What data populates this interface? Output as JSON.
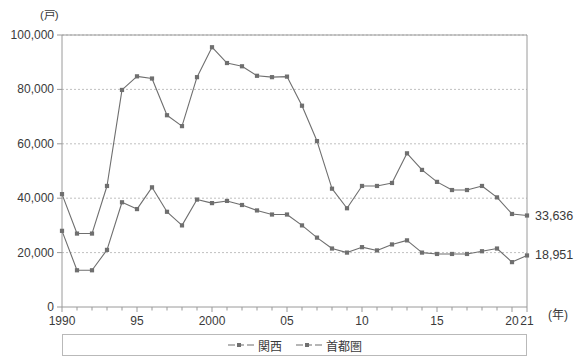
{
  "chart_data": {
    "type": "line",
    "title": "",
    "unit_label": "(戸)",
    "xlabel": "(年)",
    "ylabel": "",
    "ylim": [
      0,
      100000
    ],
    "ytick_values": [
      0,
      20000,
      40000,
      60000,
      80000,
      100000
    ],
    "ytick_labels": [
      "0",
      "20,000",
      "40,000",
      "60,000",
      "80,000",
      "100,000"
    ],
    "xlim": [
      1990,
      2021
    ],
    "xtick_values": [
      1990,
      1995,
      2000,
      2005,
      2010,
      2015,
      2020,
      2021
    ],
    "xtick_labels": [
      "1990",
      "95",
      "2000",
      "05",
      "10",
      "15",
      "20",
      "21"
    ],
    "minor_ticks_every": 1,
    "grid": "horizontal-dashed",
    "legend_position": "bottom-center",
    "x": [
      1990,
      1991,
      1992,
      1993,
      1994,
      1995,
      1996,
      1997,
      1998,
      1999,
      2000,
      2001,
      2002,
      2003,
      2004,
      2005,
      2006,
      2007,
      2008,
      2009,
      2010,
      2011,
      2012,
      2013,
      2014,
      2015,
      2016,
      2017,
      2018,
      2019,
      2020,
      2021
    ],
    "series": [
      {
        "name": "首都圏",
        "color": "#6f6f6f",
        "end_label": "33,636",
        "values": [
          41500,
          27000,
          27000,
          44500,
          79800,
          84800,
          84000,
          70500,
          66500,
          84500,
          95500,
          89700,
          88500,
          85000,
          84500,
          84700,
          74000,
          61000,
          43500,
          36300,
          44500,
          44500,
          45600,
          56500,
          50400,
          46000,
          43000,
          43000,
          44500,
          40300,
          34200,
          33636
        ]
      },
      {
        "name": "関西",
        "color": "#6f6f6f",
        "end_label": "18,951",
        "values": [
          28000,
          13500,
          13500,
          21000,
          38500,
          36000,
          44000,
          35000,
          30000,
          39500,
          38200,
          39000,
          37500,
          35500,
          34000,
          34000,
          30000,
          25500,
          21500,
          20000,
          22000,
          20800,
          23000,
          24500,
          20000,
          19500,
          19500,
          19500,
          20500,
          21500,
          16500,
          18951
        ]
      }
    ]
  },
  "legend": {
    "items": [
      {
        "label": "関西"
      },
      {
        "label": "首都圏"
      }
    ]
  }
}
